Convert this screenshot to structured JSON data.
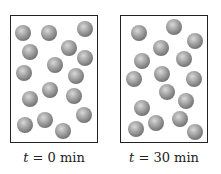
{
  "panels": [
    {
      "label": "t = 0 min",
      "label_var": "t",
      "label_rest": " = 0 min",
      "molecules": [
        [
          23,
          33
        ],
        [
          49,
          33
        ],
        [
          85,
          29
        ],
        [
          30,
          52
        ],
        [
          69,
          48
        ],
        [
          85,
          58
        ],
        [
          55,
          65
        ],
        [
          24,
          73
        ],
        [
          76,
          76
        ],
        [
          50,
          90
        ],
        [
          74,
          96
        ],
        [
          30,
          99
        ],
        [
          84,
          115
        ],
        [
          45,
          120
        ],
        [
          25,
          125
        ],
        [
          63,
          131
        ]
      ]
    },
    {
      "label": "t = 30 min",
      "label_var": "t",
      "label_rest": " = 30 min",
      "molecules": [
        [
          139,
          33
        ],
        [
          174,
          27
        ],
        [
          195,
          41
        ],
        [
          161,
          48
        ],
        [
          142,
          61
        ],
        [
          184,
          59
        ],
        [
          134,
          79
        ],
        [
          162,
          74
        ],
        [
          194,
          79
        ],
        [
          167,
          92
        ],
        [
          186,
          101
        ],
        [
          142,
          108
        ],
        [
          156,
          123
        ],
        [
          180,
          119
        ],
        [
          136,
          129
        ],
        [
          195,
          132
        ]
      ]
    }
  ],
  "colors": {
    "molecule": "#8a8a8a",
    "border": "#222222"
  }
}
